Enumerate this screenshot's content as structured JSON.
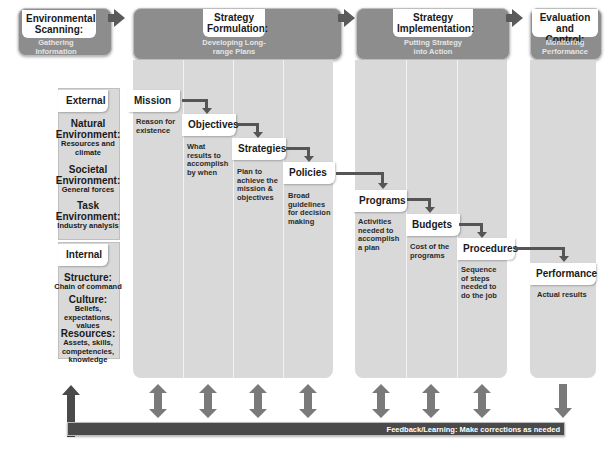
{
  "stages": [
    {
      "title": "Environmental Scanning:",
      "subtitle": "Gathering Information"
    },
    {
      "title": "Strategy Formulation:",
      "subtitle": "Developing Long-range Plans"
    },
    {
      "title": "Strategy Implementation:",
      "subtitle": "Putting Strategy into Action"
    },
    {
      "title": "Evaluation and Control:",
      "subtitle": "Monitoring Performance"
    }
  ],
  "scanning": {
    "external": {
      "label": "External",
      "items": [
        {
          "title": "Natural Environment:",
          "desc": "Resources and climate"
        },
        {
          "title": "Societal Environment:",
          "desc": "General forces"
        },
        {
          "title": "Task Environment:",
          "desc": "Industry analysis"
        }
      ]
    },
    "internal": {
      "label": "Internal",
      "items": [
        {
          "title": "Structure:",
          "desc": "Chain of command"
        },
        {
          "title": "Culture:",
          "desc": "Beliefs, expectations, values"
        },
        {
          "title": "Resources:",
          "desc": "Assets, skills, competencies, knowledge"
        }
      ]
    }
  },
  "steps": [
    {
      "label": "Mission",
      "desc": "Reason for existence"
    },
    {
      "label": "Objectives",
      "desc": "What results to accomplish by when"
    },
    {
      "label": "Strategies",
      "desc": "Plan to achieve the mission & objectives"
    },
    {
      "label": "Policies",
      "desc": "Broad guidelines for decision making"
    },
    {
      "label": "Programs",
      "desc": "Activities needed to accomplish a plan"
    },
    {
      "label": "Budgets",
      "desc": "Cost of the programs"
    },
    {
      "label": "Procedures",
      "desc": "Sequence of steps needed to do the job"
    },
    {
      "label": "Performance",
      "desc": "Actual results"
    }
  ],
  "feedback": {
    "label": "Feedback/Learning: Make corrections as needed"
  },
  "colors": {
    "header": "#8d8d8d",
    "panel": "#d9d9d9",
    "arrow": "#555555",
    "feedback": "#4a4a4a"
  }
}
